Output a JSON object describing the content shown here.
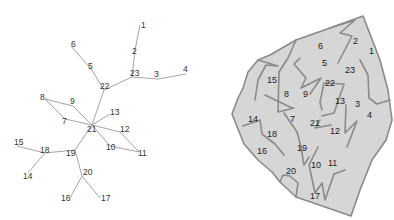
{
  "tree": {
    "nodes": [
      {
        "id": "1",
        "x": 140,
        "y": 25,
        "lx": 141,
        "ly": 28
      },
      {
        "id": "2",
        "x": 135,
        "y": 50,
        "lx": 132,
        "ly": 54
      },
      {
        "id": "23",
        "x": 132,
        "y": 77,
        "lx": 130,
        "ly": 76
      },
      {
        "id": "3",
        "x": 158,
        "y": 79,
        "lx": 154,
        "ly": 77
      },
      {
        "id": "4",
        "x": 186,
        "y": 74,
        "lx": 183,
        "ly": 72
      },
      {
        "id": "22",
        "x": 104,
        "y": 90,
        "lx": 100,
        "ly": 89
      },
      {
        "id": "5",
        "x": 92,
        "y": 70,
        "lx": 88,
        "ly": 69
      },
      {
        "id": "6",
        "x": 71,
        "y": 46,
        "lx": 71,
        "ly": 47
      },
      {
        "id": "8",
        "x": 45,
        "y": 99,
        "lx": 40,
        "ly": 100
      },
      {
        "id": "9",
        "x": 73,
        "y": 106,
        "lx": 70,
        "ly": 104
      },
      {
        "id": "7",
        "x": 65,
        "y": 119,
        "lx": 62,
        "ly": 124
      },
      {
        "id": "21",
        "x": 92,
        "y": 125,
        "lx": 87,
        "ly": 132
      },
      {
        "id": "13",
        "x": 110,
        "y": 114,
        "lx": 110,
        "ly": 115
      },
      {
        "id": "12",
        "x": 120,
        "y": 132,
        "lx": 120,
        "ly": 132
      },
      {
        "id": "10",
        "x": 110,
        "y": 146,
        "lx": 106,
        "ly": 150
      },
      {
        "id": "11",
        "x": 139,
        "y": 152,
        "lx": 138,
        "ly": 156
      },
      {
        "id": "19",
        "x": 75,
        "y": 150,
        "lx": 66,
        "ly": 156
      },
      {
        "id": "18",
        "x": 45,
        "y": 153,
        "lx": 40,
        "ly": 153
      },
      {
        "id": "15",
        "x": 17,
        "y": 146,
        "lx": 14,
        "ly": 145
      },
      {
        "id": "14",
        "x": 28,
        "y": 173,
        "lx": 23,
        "ly": 179
      },
      {
        "id": "20",
        "x": 82,
        "y": 176,
        "lx": 83,
        "ly": 175
      },
      {
        "id": "16",
        "x": 70,
        "y": 198,
        "lx": 61,
        "ly": 201
      },
      {
        "id": "17",
        "x": 100,
        "y": 198,
        "lx": 101,
        "ly": 201
      }
    ],
    "edges": [
      [
        "1",
        "2"
      ],
      [
        "2",
        "23"
      ],
      [
        "23",
        "3"
      ],
      [
        "3",
        "4"
      ],
      [
        "23",
        "22"
      ],
      [
        "22",
        "5"
      ],
      [
        "5",
        "6"
      ],
      [
        "22",
        "21"
      ],
      [
        "8",
        "9"
      ],
      [
        "9",
        "21"
      ],
      [
        "8",
        "7"
      ],
      [
        "7",
        "21"
      ],
      [
        "21",
        "13"
      ],
      [
        "21",
        "12"
      ],
      [
        "12",
        "11"
      ],
      [
        "21",
        "10"
      ],
      [
        "10",
        "11"
      ],
      [
        "21",
        "19"
      ],
      [
        "19",
        "18"
      ],
      [
        "18",
        "15"
      ],
      [
        "18",
        "14"
      ],
      [
        "19",
        "20"
      ],
      [
        "20",
        "16"
      ],
      [
        "20",
        "17"
      ]
    ]
  },
  "map": {
    "outline": "363,16 330,28 296,40 270,55 258,60 248,72 243,88 238,98 232,114 244,144 258,160 272,172 280,182 296,197 328,208 351,216 360,190 372,160 386,140 392,120 388,90 380,60",
    "walls": [
      "330,28 355,20 340,33 352,36 338,63",
      "296,40 288,58 279,72 278,112 294,108",
      "300,58 294,64 306,78 301,88 321,78 310,94",
      "322,110 320,102 324,83 344,84 334,113 322,116",
      "320,120 315,128 331,125",
      "360,60 368,75 369,98 377,104 390,100",
      "346,105 345,133 357,121 347,147",
      "265,95 292,108",
      "258,60 278,66 266,65 258,80 255,100",
      "243,126 260,120 262,134 275,144 284,155",
      "284,113 297,132 301,147 304,165 309,157",
      "318,147 309,165 315,193 322,183 325,200 334,174 345,170",
      "280,182 283,175 290,176 298,183 296,197"
    ],
    "labels": [
      {
        "id": "1",
        "x": 369,
        "y": 54
      },
      {
        "id": "2",
        "x": 353,
        "y": 44
      },
      {
        "id": "6",
        "x": 318,
        "y": 49
      },
      {
        "id": "5",
        "x": 322,
        "y": 66
      },
      {
        "id": "23",
        "x": 345,
        "y": 73
      },
      {
        "id": "15",
        "x": 267,
        "y": 83
      },
      {
        "id": "22",
        "x": 325,
        "y": 86
      },
      {
        "id": "8",
        "x": 284,
        "y": 97
      },
      {
        "id": "9",
        "x": 303,
        "y": 97
      },
      {
        "id": "13",
        "x": 335,
        "y": 104
      },
      {
        "id": "3",
        "x": 355,
        "y": 107
      },
      {
        "id": "4",
        "x": 367,
        "y": 118
      },
      {
        "id": "14",
        "x": 248,
        "y": 122
      },
      {
        "id": "7",
        "x": 290,
        "y": 122
      },
      {
        "id": "21",
        "x": 310,
        "y": 126
      },
      {
        "id": "12",
        "x": 330,
        "y": 134
      },
      {
        "id": "18",
        "x": 267,
        "y": 137
      },
      {
        "id": "19",
        "x": 297,
        "y": 151
      },
      {
        "id": "16",
        "x": 257,
        "y": 154
      },
      {
        "id": "10",
        "x": 311,
        "y": 168
      },
      {
        "id": "11",
        "x": 328,
        "y": 166
      },
      {
        "id": "20",
        "x": 286,
        "y": 174
      },
      {
        "id": "17",
        "x": 310,
        "y": 199
      }
    ]
  },
  "colors": {
    "region_fill": "#d6d6d6",
    "region_stroke": "#8a8a8a",
    "edge": "#9a9a9a",
    "text": "#333333"
  }
}
